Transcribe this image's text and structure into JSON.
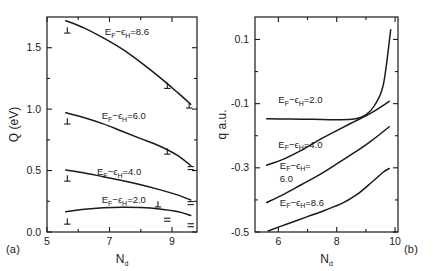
{
  "figure": {
    "panel_a_tag": "(a)",
    "panel_b_tag": "(b)"
  },
  "chart_data": [
    {
      "type": "line",
      "panel": "(a)",
      "title": "",
      "xlabel": "N_d",
      "ylabel": "Q (eV)",
      "xlim": [
        5,
        9.8
      ],
      "ylim": [
        0.0,
        1.75
      ],
      "xticks": [
        5,
        7,
        9
      ],
      "xtick_labels": [
        "5",
        "7",
        "9"
      ],
      "xminor": [
        6,
        8
      ],
      "yticks": [
        0.0,
        0.5,
        1.0,
        1.5
      ],
      "ytick_labels": [
        "0.0",
        "0.5",
        "1.0",
        "1.5"
      ],
      "yminor": [
        0.25,
        0.75,
        1.25
      ],
      "grid": false,
      "legend": "inline-labels",
      "series": [
        {
          "name": "E_F - e_H = 8.6",
          "label_text": "E",
          "label_sub1": "F",
          "label_dash": "−",
          "label_eps": "ϵ",
          "label_sub2": "H",
          "label_value": "=8.6",
          "x": [
            5.6,
            6.2,
            6.8,
            7.4,
            8.0,
            8.6,
            9.2,
            9.6
          ],
          "y": [
            1.72,
            1.66,
            1.58,
            1.49,
            1.38,
            1.26,
            1.13,
            1.04
          ]
        },
        {
          "name": "E_F - e_H = 6.0",
          "label_value": "=6.0",
          "x": [
            5.6,
            6.2,
            6.8,
            7.4,
            8.0,
            8.6,
            9.2,
            9.6
          ],
          "y": [
            0.97,
            0.93,
            0.88,
            0.82,
            0.76,
            0.7,
            0.62,
            0.54
          ]
        },
        {
          "name": "E_F - e_H = 4.0",
          "label_value": "=4.0",
          "x": [
            5.6,
            6.2,
            6.8,
            7.4,
            8.0,
            8.6,
            9.2,
            9.6
          ],
          "y": [
            0.505,
            0.48,
            0.45,
            0.42,
            0.385,
            0.345,
            0.3,
            0.26
          ]
        },
        {
          "name": "E_F - e_H = 2.0",
          "label_value": "=2.0",
          "x": [
            5.6,
            6.2,
            6.8,
            7.4,
            8.0,
            8.6,
            9.2,
            9.6
          ],
          "y": [
            0.165,
            0.185,
            0.197,
            0.202,
            0.2,
            0.188,
            0.165,
            0.135
          ]
        }
      ],
      "markers_perp": [
        {
          "x": 5.65,
          "y": 1.64
        },
        {
          "x": 8.85,
          "y": 1.19
        },
        {
          "x": 9.55,
          "y": 1.03
        },
        {
          "x": 5.65,
          "y": 0.9
        },
        {
          "x": 8.85,
          "y": 0.655
        },
        {
          "x": 5.65,
          "y": 0.435
        },
        {
          "x": 8.55,
          "y": 0.225
        },
        {
          "x": 5.65,
          "y": 0.085
        }
      ],
      "markers_eq": [
        {
          "x": 9.6,
          "y": 0.52
        },
        {
          "x": 9.6,
          "y": 0.235
        },
        {
          "x": 8.85,
          "y": 0.1
        },
        {
          "x": 9.6,
          "y": 0.055
        }
      ]
    },
    {
      "type": "line",
      "panel": "(b)",
      "title": "",
      "xlabel": "N_d",
      "ylabel": "q a.u.",
      "xlim": [
        5.2,
        10.1
      ],
      "ylim": [
        -0.5,
        0.17
      ],
      "xticks": [
        6,
        8,
        10
      ],
      "xtick_labels": [
        "6",
        "8",
        "10"
      ],
      "xminor": [
        7,
        9
      ],
      "yticks": [
        0.1,
        -0.1,
        -0.3,
        -0.5
      ],
      "ytick_labels": [
        "0.1",
        "-0.1",
        "-0.3",
        "-0.5"
      ],
      "yminor": [
        0.0,
        -0.2,
        -0.4
      ],
      "grid": false,
      "legend": "inline-labels",
      "series": [
        {
          "name": "E_F - e_H = 2.0",
          "label_value": "=2.0",
          "x": [
            5.6,
            6.4,
            7.2,
            8.0,
            8.6,
            9.0,
            9.3,
            9.6,
            9.85
          ],
          "y": [
            -0.147,
            -0.148,
            -0.149,
            -0.15,
            -0.148,
            -0.135,
            -0.105,
            -0.04,
            0.13
          ]
        },
        {
          "name": "E_F - e_H = 4.0",
          "label_value": "=4.0",
          "x": [
            5.6,
            6.2,
            6.8,
            7.4,
            8.0,
            8.6,
            9.2,
            9.8
          ],
          "y": [
            -0.292,
            -0.272,
            -0.245,
            -0.213,
            -0.184,
            -0.156,
            -0.128,
            -0.093
          ]
        },
        {
          "name": "E_F - e_H = 6.0",
          "label_value": "6.0",
          "x": [
            5.6,
            6.2,
            6.8,
            7.4,
            8.0,
            8.6,
            9.2,
            9.8
          ],
          "y": [
            -0.408,
            -0.382,
            -0.352,
            -0.322,
            -0.288,
            -0.253,
            -0.215,
            -0.172
          ]
        },
        {
          "name": "E_F - e_H = 8.6",
          "label_value": "=8.6",
          "x": [
            5.65,
            6.3,
            7.0,
            7.6,
            8.2,
            8.7,
            9.2,
            9.6,
            9.8
          ],
          "y": [
            -0.497,
            -0.475,
            -0.452,
            -0.432,
            -0.41,
            -0.383,
            -0.345,
            -0.313,
            -0.302
          ]
        }
      ],
      "markers_perp": [],
      "markers_eq": []
    }
  ]
}
